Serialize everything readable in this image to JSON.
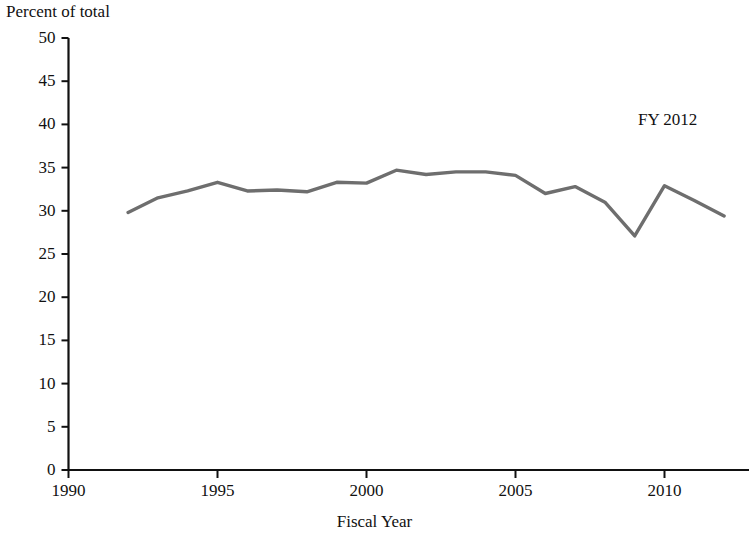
{
  "chart_data": {
    "type": "line",
    "title": "",
    "ylabel": "Percent of total",
    "xlabel": "Fiscal Year",
    "annotation": "FY 2012",
    "ylim": [
      0,
      50
    ],
    "xlim": [
      1990,
      2013
    ],
    "yticks": [
      0,
      5,
      10,
      15,
      20,
      25,
      30,
      35,
      40,
      45,
      50
    ],
    "ytick_labels": [
      "0",
      "5",
      "10",
      "15",
      "20",
      "25",
      "30",
      "35",
      "40",
      "45",
      "50"
    ],
    "xticks": [
      1990,
      1995,
      2000,
      2005,
      2010
    ],
    "xtick_labels": [
      "1990",
      "1995",
      "2000",
      "2005",
      "2010"
    ],
    "grid": false,
    "legend": false,
    "line_color": "#6e6e6e",
    "line_width": 3.4,
    "axis_color": "#111111",
    "x": [
      1992,
      1993,
      1994,
      1995,
      1996,
      1997,
      1998,
      1999,
      2000,
      2001,
      2002,
      2003,
      2004,
      2005,
      2006,
      2007,
      2008,
      2009,
      2010,
      2011,
      2012
    ],
    "values": [
      29.8,
      31.5,
      32.3,
      33.3,
      32.3,
      32.4,
      32.2,
      33.3,
      33.2,
      34.7,
      34.2,
      34.5,
      34.5,
      34.1,
      32.0,
      32.8,
      31.0,
      27.1,
      32.9,
      31.2,
      29.4
    ],
    "series": [
      {
        "name": "Percent of total",
        "values": [
          29.8,
          31.5,
          32.3,
          33.3,
          32.3,
          32.4,
          32.2,
          33.3,
          33.2,
          34.7,
          34.2,
          34.5,
          34.5,
          34.1,
          32.0,
          32.8,
          31.0,
          27.1,
          32.9,
          31.2,
          29.4
        ]
      }
    ]
  }
}
